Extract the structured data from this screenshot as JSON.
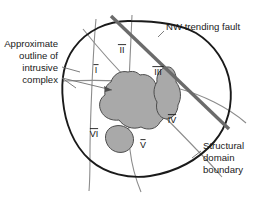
{
  "figure": {
    "background_color": "#ffffff"
  },
  "annotations": {
    "intrusive_outline": {
      "name": "Approximate outline of intrusive complex",
      "lines": [
        "Approximate",
        "outline of",
        "intrusive",
        "complex"
      ],
      "align": "right",
      "x": 58,
      "y_start": 47
    },
    "nw_fault": {
      "name": "NW trending fault",
      "lines": [
        "NW trending fault"
      ],
      "align": "left",
      "x": 166,
      "y_start": 27
    },
    "structural_boundary": {
      "name": "Structural domain boundary",
      "lines": [
        "Structural",
        "domain",
        "boundary"
      ],
      "align": "left",
      "x": 203,
      "y_start": 146
    }
  },
  "domain_labels": [
    {
      "id": "I",
      "text": "I",
      "x": 96,
      "y": 73
    },
    {
      "id": "II",
      "text": "II",
      "x": 122,
      "y": 53
    },
    {
      "id": "III",
      "text": "III",
      "x": 158,
      "y": 75
    },
    {
      "id": "IV",
      "text": "IV",
      "x": 172,
      "y": 123
    },
    {
      "id": "V",
      "text": "V",
      "x": 143,
      "y": 148
    },
    {
      "id": "VI",
      "text": "VI",
      "x": 94,
      "y": 137
    }
  ],
  "colors": {
    "outline_stroke": "#1a1a1a",
    "fault_stroke": "#6b6b6b",
    "boundary_stroke": "#8c8c8c",
    "intrusive_fill": "#a9a9a9",
    "intrusive_stroke": "#4d4d4d",
    "leader_stroke": "#6f6f6f",
    "text_color": "#1a1a1a"
  },
  "geometry": {
    "complex_outline": "M 131 21 C 108 20 86 31 74 48 C 63 63 61 83 63 101 C 65 122 73 145 90 160 C 106 174 129 179 150 176 C 175 172 198 160 214 142 C 228 126 233 104 230 84 C 227 63 214 44 196 33 C 178 23 154 21 131 21 Z",
    "fault_line": "M 111 16 L 229 129",
    "intrusive_bodies": [
      "M 128 72 C 120 70 113 75 111 82 C 107 84 104 89 105 95 C 100 98 98 105 101 111 C 104 118 112 121 119 120 C 124 127 133 130 141 127 C 148 131 157 129 160 122 C 166 118 167 109 163 103 C 166 96 163 88 156 85 C 154 78 147 73 140 75 C 136 71 132 71 128 72 Z",
      "M 167 67 C 160 68 156 75 157 82 C 153 88 153 96 157 102 C 155 110 159 118 166 119 C 173 119 178 112 178 105 C 182 98 181 88 176 82 C 177 74 173 66 167 67 Z",
      "M 115 126 C 108 127 104 134 106 141 C 108 149 116 154 124 152 C 131 150 135 143 133 136 C 131 129 123 124 115 126 Z"
    ],
    "boundary_lines": [
      "M 96 19 C 94 40 93 62 92 84 C 91 107 90 130 90 152 C 90 168 90 180 89 191",
      "M 132 15 C 131 38 130 60 129 82 C 128 105 128 128 130 150 C 132 167 136 180 141 192",
      "M 62 81 C 88 80 114 80 140 82 C 166 84 192 91 214 102 C 228 109 238 116 246 123",
      "M 83 29 C 99 49 116 68 134 86 C 154 106 176 128 196 149 C 207 160 215 169 222 177"
    ],
    "leaders": [
      "M 62 67 L 80 72",
      "M 62 78 L 76 88",
      "M 62 78 L 112 90",
      "M 164 31 L 158 37",
      "M 201 151 L 192 158"
    ]
  }
}
